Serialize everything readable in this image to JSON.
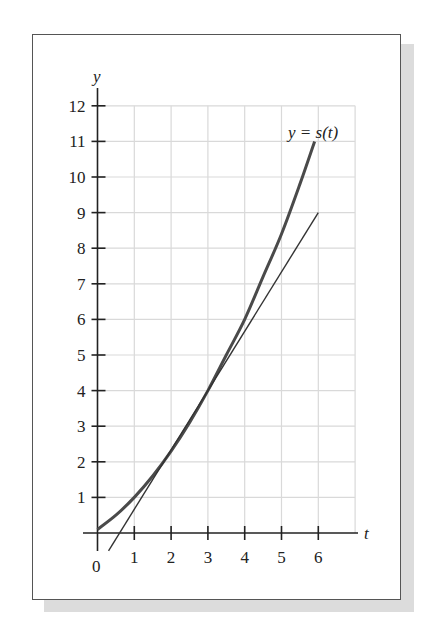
{
  "chart_data": {
    "type": "line",
    "title": "",
    "xlabel": "t",
    "ylabel": "y",
    "xlim": [
      0,
      7
    ],
    "ylim": [
      0,
      12
    ],
    "x_ticks": [
      0,
      1,
      2,
      3,
      4,
      5,
      6
    ],
    "y_ticks": [
      1,
      2,
      3,
      4,
      5,
      6,
      7,
      8,
      9,
      10,
      11,
      12
    ],
    "grid": true,
    "annotations": [
      {
        "text": "y = s(t)",
        "near": [
          5.9,
          11
        ]
      }
    ],
    "series": [
      {
        "name": "s(t)",
        "style": "thick curve",
        "x": [
          0,
          0.5,
          1,
          1.5,
          2,
          2.5,
          3,
          3.5,
          4,
          4.5,
          5,
          5.5,
          5.9
        ],
        "y": [
          0.1,
          0.5,
          1.0,
          1.6,
          2.3,
          3.1,
          4.0,
          5.0,
          6.0,
          7.2,
          8.4,
          9.8,
          11.0
        ]
      },
      {
        "name": "tangent line at t=3",
        "style": "thin line",
        "x": [
          0.3,
          6
        ],
        "y": [
          -0.5,
          9
        ]
      }
    ]
  },
  "labels": {
    "y_axis": "y",
    "x_axis": "t",
    "curve": "y = s(t)",
    "origin": "0"
  }
}
